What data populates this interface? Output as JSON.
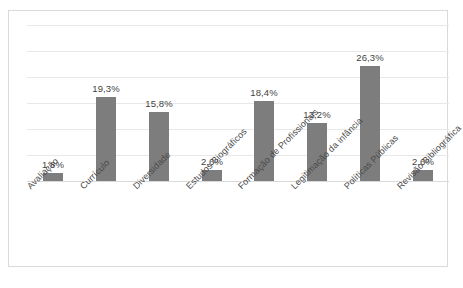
{
  "chart_data": {
    "type": "bar",
    "title": "",
    "subtitle": "",
    "xlabel": "",
    "ylabel": "",
    "ylim": [
      0,
      30
    ],
    "grid": true,
    "legend": "none",
    "gridline_count": 6,
    "axis_tick_labels": [],
    "categories": [
      "Avaliação",
      "Currículo",
      "Diversidade",
      "Estudos Biográficos",
      "Formação de Profissionais",
      "Legitimação da infância",
      "Políticas Públicas",
      "Revisão Bibliográfica"
    ],
    "values": [
      1.8,
      19.3,
      15.8,
      2.6,
      18.4,
      13.2,
      26.3,
      2.6
    ],
    "data_labels": [
      "1,8%",
      "19,3%",
      "15,8%",
      "2,6%",
      "18,4%",
      "13,2%",
      "26,3%",
      "2,6%"
    ],
    "bar_color": "#7d7d7d",
    "gridline_color": "#e8e8e8",
    "frame_color": "#d9d9d9",
    "label_color": "#4a4a4a"
  }
}
